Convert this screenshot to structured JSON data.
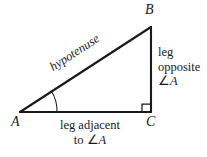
{
  "figure": {
    "background_color": "#ffffff",
    "stroke_color": "#1a1a1a",
    "vertices": {
      "A": {
        "label": "A",
        "x": 20,
        "y": 112
      },
      "B": {
        "label": "B",
        "x": 151,
        "y": 27
      },
      "C": {
        "label": "C",
        "x": 151,
        "y": 112
      }
    },
    "labels": {
      "hypotenuse": "hypotenuse",
      "opposite_line1": "leg",
      "opposite_line2": "opposite",
      "opposite_line3_symbol": "∠",
      "opposite_line3_var": "A",
      "adjacent_line1": "leg adjacent",
      "adjacent_line2_prefix": "to ",
      "adjacent_line2_symbol": "∠",
      "adjacent_line2_var": "A"
    },
    "markers": {
      "angle_arc_at": "A",
      "right_angle_at": "C",
      "right_angle_size": 8
    }
  }
}
